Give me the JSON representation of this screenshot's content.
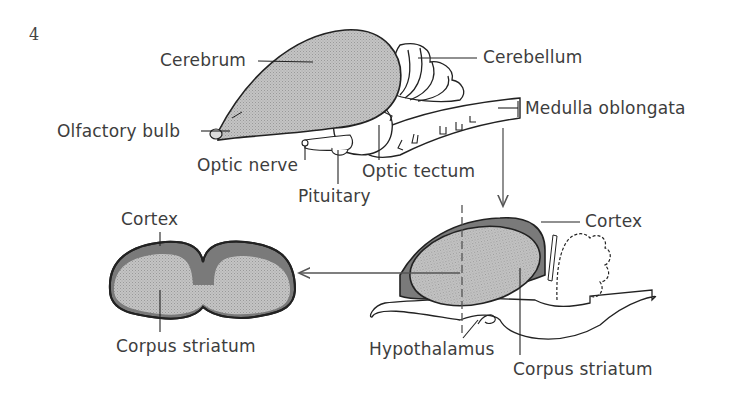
{
  "figure": {
    "number": "4",
    "colors": {
      "background": "#ffffff",
      "outline": "#222222",
      "stipple_fill": "#b8b8b8",
      "cortex_fill": "#7a7a7a",
      "arrow": "#666666",
      "text": "#3d3d3d"
    }
  },
  "whole_brain": {
    "labels": {
      "cerebrum": "Cerebrum",
      "cerebellum": "Cerebellum",
      "olfactory_bulb": "Olfactory bulb",
      "medulla_oblongata": "Medulla oblongata",
      "optic_nerve": "Optic nerve",
      "optic_tectum": "Optic tectum",
      "pituitary": "Pituitary"
    }
  },
  "sagittal_section": {
    "labels": {
      "cortex": "Cortex",
      "hypothalamus": "Hypothalamus",
      "corpus_striatum": "Corpus striatum"
    }
  },
  "transverse_section": {
    "labels": {
      "cortex": "Cortex",
      "corpus_striatum": "Corpus striatum"
    }
  }
}
